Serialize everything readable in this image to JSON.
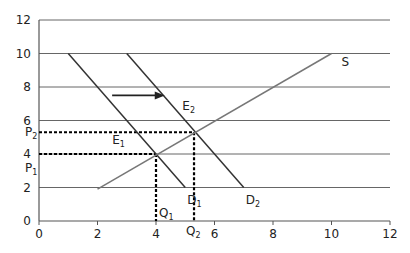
{
  "chart_data": {
    "type": "line",
    "title": "",
    "xlabel": "",
    "ylabel": "",
    "xlim": [
      0,
      12
    ],
    "ylim": [
      0,
      12
    ],
    "x_ticks": [
      "0",
      "2",
      "4",
      "6",
      "8",
      "10",
      "12"
    ],
    "y_ticks": [
      "0",
      "2",
      "4",
      "6",
      "8",
      "10",
      "12"
    ],
    "grid": "horizontal",
    "series": [
      {
        "name": "D1",
        "label": "D",
        "sub": "1",
        "points": [
          [
            1,
            10
          ],
          [
            5,
            2
          ]
        ]
      },
      {
        "name": "D2",
        "label": "D",
        "sub": "2",
        "points": [
          [
            3,
            10
          ],
          [
            7,
            2
          ]
        ]
      },
      {
        "name": "S",
        "label": "S",
        "sub": "",
        "points": [
          [
            2,
            1.9
          ],
          [
            10,
            10
          ]
        ]
      }
    ],
    "equilibria": [
      {
        "name": "E1",
        "x": 4,
        "y": 4,
        "label": "E",
        "sub": "1",
        "price_label": "P",
        "price_sub": "1",
        "qty_label": "Q",
        "qty_sub": "1"
      },
      {
        "name": "E2",
        "x": 5.3,
        "y": 5.3,
        "label": "E",
        "sub": "2",
        "price_label": "P",
        "price_sub": "2",
        "qty_label": "Q",
        "qty_sub": "2"
      }
    ],
    "annotations": [
      {
        "type": "arrow",
        "from": [
          2.5,
          7.5
        ],
        "to": [
          4.3,
          7.5
        ],
        "meaning": "demand shift right"
      }
    ]
  }
}
